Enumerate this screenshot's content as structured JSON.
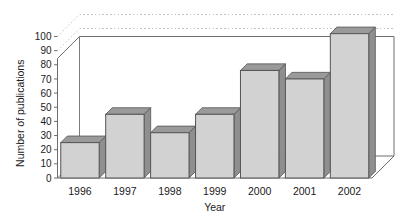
{
  "chart_data": {
    "type": "bar",
    "title": "",
    "subtitle": "",
    "xlabel": "Year",
    "ylabel": "Number of publications",
    "categories": [
      "1996",
      "1997",
      "1998",
      "1999",
      "2000",
      "2001",
      "2002"
    ],
    "values": [
      25,
      45,
      32,
      45,
      76,
      70,
      102
    ],
    "ylim": [
      0,
      100
    ],
    "ytick_step": 10,
    "ytick_labels": [
      "0",
      "10",
      "20",
      "30",
      "40",
      "50",
      "60",
      "70",
      "80",
      "90",
      "100"
    ],
    "grid": true,
    "grid_style": "dotted-horizontal",
    "legend": "none",
    "legend_position": "none",
    "style": "3d-bar",
    "annotations": []
  },
  "colors": {
    "bar_front": "#d2d2d2",
    "bar_top": "#9a9a9a",
    "bar_side": "#8f8f8f",
    "bar_outline": "#555555",
    "grid": "#bdbdbd",
    "axis": "#6d6d6d",
    "floor": "#ffffff",
    "text": "#1a1a1a",
    "background": "#ffffff"
  }
}
